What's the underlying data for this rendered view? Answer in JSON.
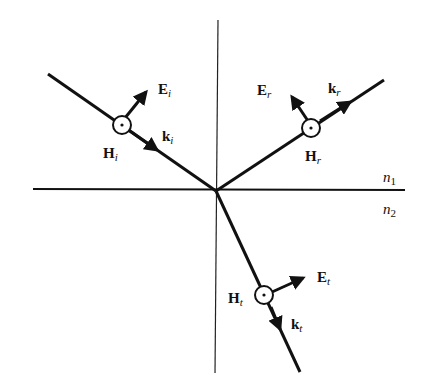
{
  "diagram": {
    "media": {
      "upper": {
        "label": "n",
        "sub": "1"
      },
      "lower": {
        "label": "n",
        "sub": "2"
      }
    },
    "incident": {
      "E": {
        "label": "E",
        "sub": "i"
      },
      "k": {
        "label": "k",
        "sub": "i"
      },
      "H": {
        "label": "H",
        "sub": "i"
      }
    },
    "reflected": {
      "E": {
        "label": "E",
        "sub": "r"
      },
      "k": {
        "label": "k",
        "sub": "r"
      },
      "H": {
        "label": "H",
        "sub": "r"
      }
    },
    "transmitted": {
      "E": {
        "label": "E",
        "sub": "t"
      },
      "k": {
        "label": "k",
        "sub": "t"
      },
      "H": {
        "label": "H",
        "sub": "t"
      }
    },
    "colors": {
      "line": "#111111",
      "background": "#ffffff"
    }
  }
}
